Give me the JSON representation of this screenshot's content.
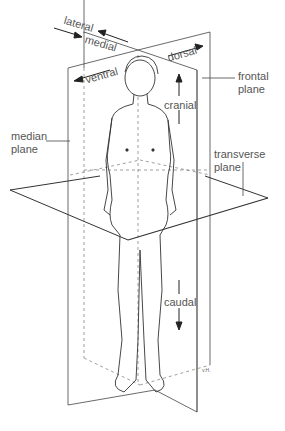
{
  "diagram": {
    "labels": {
      "lateral": "lateral",
      "medial": "medial",
      "ventral": "ventral",
      "dorsal": "dorsal",
      "cranial": "cranial",
      "caudal": "caudal",
      "frontal_plane_line1": "frontal",
      "frontal_plane_line2": "plane",
      "median_plane_line1": "median",
      "median_plane_line2": "plane",
      "transverse_plane_line1": "transverse",
      "transverse_plane_line2": "plane"
    },
    "signature": "v.H.",
    "colors": {
      "line": "#333333",
      "text": "#555555",
      "dashed": "#777777",
      "background": "#ffffff"
    }
  }
}
